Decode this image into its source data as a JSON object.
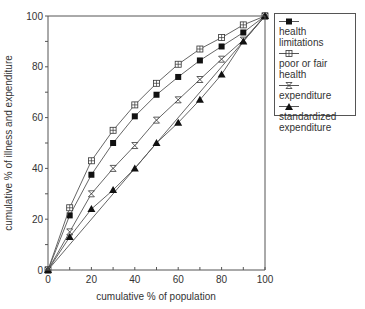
{
  "chart_data": {
    "type": "line",
    "title": "",
    "xlabel": "cumulative % of population",
    "ylabel": "cumulative % of illness and expenditure",
    "xlim": [
      0,
      100
    ],
    "ylim": [
      0,
      100
    ],
    "x_ticks": [
      0,
      20,
      40,
      60,
      80,
      100
    ],
    "y_ticks": [
      0,
      20,
      40,
      60,
      80,
      100
    ],
    "minor_tick_step": 10,
    "grid": false,
    "legend_position": "upper right, outside plot",
    "x": [
      0,
      10,
      20,
      30,
      40,
      50,
      60,
      70,
      80,
      90,
      100
    ],
    "series": [
      {
        "name": "health limitations",
        "marker": "filled-square",
        "values": [
          0,
          21.5,
          37.5,
          50,
          60.5,
          69,
          76,
          82.5,
          88,
          93.5,
          100
        ]
      },
      {
        "name": "poor or fair health",
        "marker": "open-square-cross",
        "values": [
          0,
          24.5,
          43,
          55,
          65,
          73.5,
          81,
          87,
          91.5,
          96.5,
          100
        ]
      },
      {
        "name": "expenditure",
        "marker": "hourglass",
        "values": [
          0,
          15,
          30,
          40,
          49,
          59,
          67,
          75,
          83,
          90.5,
          100
        ]
      },
      {
        "name": "standardized expenditure",
        "marker": "filled-triangle",
        "values": [
          0,
          13,
          24,
          31.5,
          40,
          50,
          58,
          67,
          77,
          90,
          100
        ]
      }
    ],
    "reference_line": {
      "name": "line of equality",
      "x": [
        0,
        100
      ],
      "y": [
        0,
        100
      ]
    }
  },
  "legend": {
    "items": [
      {
        "label": "health limitations"
      },
      {
        "label": "poor or fair health"
      },
      {
        "label": "expenditure"
      },
      {
        "label": "standardized expenditure"
      }
    ]
  },
  "colors": {
    "line": "#555555",
    "marker": "#111111",
    "axis": "#555555"
  }
}
